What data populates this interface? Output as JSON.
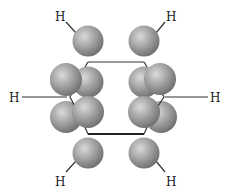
{
  "diagram": {
    "title": "",
    "colors": {
      "sphere_light": "#d6d6d6",
      "sphere_mid": "#9a9a9a",
      "sphere_dark": "#6e6e6e",
      "bond": "#333333",
      "label": "#222222"
    },
    "labels": {
      "h_top_left": "H",
      "h_top_right": "H",
      "h_left": "H",
      "h_right": "H",
      "h_bottom_left": "H",
      "h_bottom_right": "H"
    },
    "atoms": [
      {
        "id": "C1",
        "position": "top-left"
      },
      {
        "id": "C2",
        "position": "top-right"
      },
      {
        "id": "C3",
        "position": "right"
      },
      {
        "id": "C4",
        "position": "bottom-right"
      },
      {
        "id": "C5",
        "position": "bottom-left"
      },
      {
        "id": "C6",
        "position": "left"
      }
    ],
    "orbital_lobe_count": 12
  }
}
